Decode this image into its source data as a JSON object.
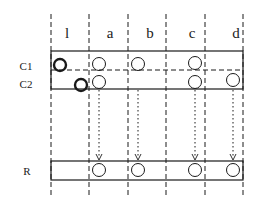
{
  "diagram": {
    "type": "relation-join-schematic",
    "columns": [
      {
        "id": "l",
        "label": "l",
        "x_left": 51,
        "x_right": 89,
        "label_x": 67
      },
      {
        "id": "a",
        "label": "a",
        "x_left": 89,
        "x_right": 128,
        "label_x": 110
      },
      {
        "id": "b",
        "label": "b",
        "x_left": 128,
        "x_right": 166,
        "label_x": 150
      },
      {
        "id": "c",
        "label": "c",
        "x_left": 166,
        "x_right": 205,
        "label_x": 192
      },
      {
        "id": "d",
        "label": "d",
        "x_left": 205,
        "x_right": 243,
        "label_x": 236
      }
    ],
    "rows": [
      {
        "id": "C1",
        "label": "C1",
        "label_y": 70
      },
      {
        "id": "C2",
        "label": "C2",
        "label_y": 88
      },
      {
        "id": "R",
        "label": "R",
        "label_y": 175
      }
    ],
    "circles": [
      {
        "row": "C1",
        "col": "l",
        "cx": 60,
        "cy": 65,
        "bold": true
      },
      {
        "row": "C1",
        "col": "a",
        "cx": 99,
        "cy": 64,
        "bold": false
      },
      {
        "row": "C1",
        "col": "b",
        "cx": 138,
        "cy": 64,
        "bold": false
      },
      {
        "row": "C1",
        "col": "c",
        "cx": 195,
        "cy": 63,
        "bold": false
      },
      {
        "row": "C2",
        "col": "l",
        "cx": 81,
        "cy": 85,
        "bold": true
      },
      {
        "row": "C2",
        "col": "a",
        "cx": 99,
        "cy": 82,
        "bold": false
      },
      {
        "row": "C2",
        "col": "c",
        "cx": 195,
        "cy": 82,
        "bold": false
      },
      {
        "row": "C2",
        "col": "d",
        "cx": 233,
        "cy": 80,
        "bold": false
      },
      {
        "row": "R",
        "col": "a",
        "cx": 99,
        "cy": 170,
        "bold": false
      },
      {
        "row": "R",
        "col": "b",
        "cx": 138,
        "cy": 170,
        "bold": false
      },
      {
        "row": "R",
        "col": "c",
        "cx": 195,
        "cy": 170,
        "bold": false
      },
      {
        "row": "R",
        "col": "d",
        "cx": 233,
        "cy": 170,
        "bold": false
      }
    ],
    "arrows": [
      {
        "col": "a",
        "x": 99
      },
      {
        "col": "b",
        "x": 138
      },
      {
        "col": "c",
        "x": 195
      },
      {
        "col": "d",
        "x": 233
      }
    ],
    "colors": {
      "stroke": "#1a1a1a",
      "background": "#ffffff"
    }
  }
}
